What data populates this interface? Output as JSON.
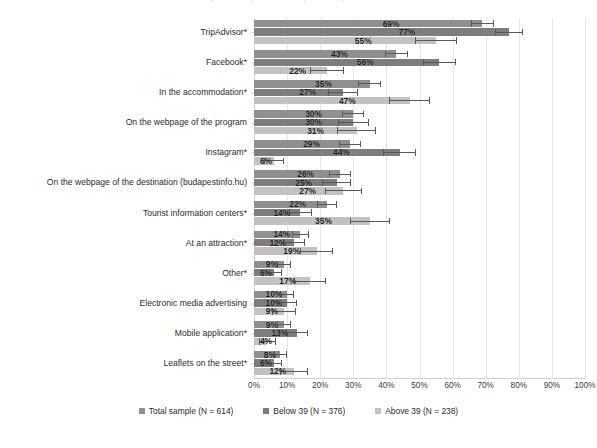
{
  "title": {
    "text": "Information sources used by tourists (share of respondents)"
  },
  "legend": {
    "position": "bottom",
    "items": [
      {
        "label": "Total sample (N = 614)",
        "color": "#8f8f8f",
        "swatch_name": "legend-swatch-total"
      },
      {
        "label": "Below 39 (N = 376)",
        "color": "#7d7d7d",
        "swatch_name": "legend-swatch-below39"
      },
      {
        "label": "Above 39 (N = 238)",
        "color": "#c2c2c2",
        "swatch_name": "legend-swatch-above39"
      }
    ]
  },
  "axis": {
    "xlabel": "",
    "ylabel": "",
    "xlim": [
      0,
      100
    ],
    "xticks": [
      "0%",
      "10%",
      "20%",
      "30%",
      "40%",
      "50%",
      "60%",
      "70%",
      "80%",
      "90%",
      "100%"
    ],
    "grid": true
  },
  "chart_data": {
    "type": "bar",
    "orientation": "horizontal",
    "title": "Information sources used by tourists (share of respondents)",
    "xlabel": "",
    "ylabel": "",
    "xlim": [
      0,
      100
    ],
    "grid": true,
    "legend_position": "bottom",
    "unit": "%",
    "categories": [
      "TripAdvisor*",
      "Facebook*",
      "In the accommodation*",
      "On the webpage of the program",
      "Instagram*",
      "On the webpage of the destination (budapestinfo.hu)",
      "Tourist information centers*",
      "At an attraction*",
      "Other*",
      "Electronic media advertising",
      "Mobile application*",
      "Leaflets on the street*"
    ],
    "series": [
      {
        "name": "Total sample (N = 614)",
        "color": "#8f8f8f",
        "values": [
          69,
          43,
          35,
          30,
          29,
          26,
          22,
          14,
          9,
          10,
          9,
          8
        ],
        "errors": [
          3.5,
          3.5,
          3.5,
          3.3,
          3.3,
          3.2,
          3.0,
          2.5,
          2.1,
          2.2,
          2.1,
          2.0
        ]
      },
      {
        "name": "Below 39 (N = 376)",
        "color": "#7d7d7d",
        "values": [
          77,
          56,
          27,
          30,
          44,
          25,
          14,
          12,
          6,
          10,
          13,
          6
        ],
        "errors": [
          4.2,
          5.0,
          4.5,
          4.6,
          5.0,
          4.4,
          3.5,
          3.3,
          2.4,
          3.0,
          3.4,
          2.4
        ]
      },
      {
        "name": "Above 39 (N = 238)",
        "color": "#c2c2c2",
        "values": [
          55,
          22,
          47,
          31,
          6,
          27,
          35,
          19,
          17,
          9,
          4,
          12
        ],
        "errors": [
          6.3,
          5.2,
          6.3,
          5.8,
          3.0,
          5.6,
          6.0,
          5.0,
          4.8,
          3.6,
          2.5,
          4.2
        ]
      }
    ]
  }
}
